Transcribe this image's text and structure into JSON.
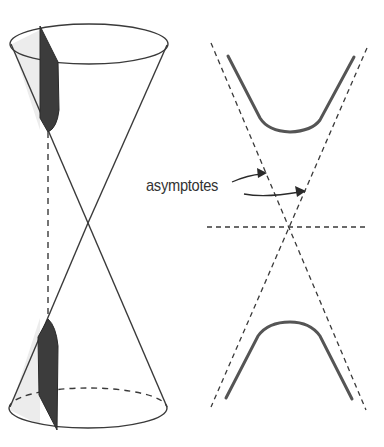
{
  "figure": {
    "title": "",
    "colors": {
      "line": "#3a3a3a",
      "curve": "#555555",
      "section_fill": "#3c3c3c",
      "cone_shade": "#ececec",
      "background": "#ffffff"
    }
  },
  "labels": {
    "asymptotes": "asymptotes"
  },
  "parts": {
    "left": "double-cone with vertical cutting plane",
    "right": "hyperbola with two branches and dashed asymptotes"
  }
}
